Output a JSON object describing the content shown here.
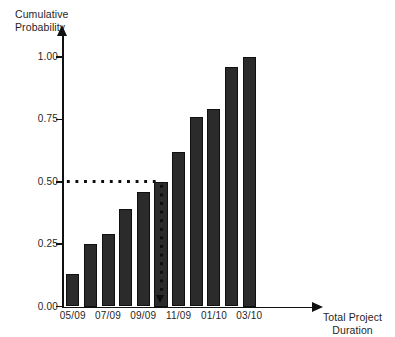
{
  "chart_data": {
    "type": "bar",
    "title": "",
    "subtitle": "",
    "xlabel": "Total Project\nDuration",
    "ylabel": "Cumulative\nProbability",
    "ylim": [
      0.0,
      1.0
    ],
    "grid": false,
    "legend": null,
    "categories": [
      "05/09",
      "06/09",
      "07/09",
      "08/09",
      "09/09",
      "10/09",
      "11/09",
      "12/09",
      "01/10",
      "02/10",
      "03/10"
    ],
    "values": [
      0.13,
      0.25,
      0.29,
      0.39,
      0.46,
      0.5,
      0.62,
      0.76,
      0.79,
      0.96,
      1.0
    ],
    "x_tick_labels": [
      "05/09",
      "07/09",
      "09/09",
      "11/09",
      "01/10",
      "03/10"
    ],
    "x_tick_category_indices": [
      0,
      2,
      4,
      6,
      8,
      10
    ],
    "y_tick_labels": [
      "1.00",
      "0.75",
      "0.50",
      "0.25",
      "0.00"
    ],
    "y_tick_values": [
      1.0,
      0.75,
      0.5,
      0.25,
      0.0
    ],
    "annotations": [
      {
        "name": "median-guide",
        "kind": "dotted-crosshair",
        "y_value": 0.5,
        "category": "10/09",
        "category_index": 5,
        "label": ""
      }
    ],
    "bar_color": "#2b2b2b",
    "axis_color": "#111111",
    "annotation_color": "#0d0d0d",
    "background_color": "#ffffff"
  }
}
